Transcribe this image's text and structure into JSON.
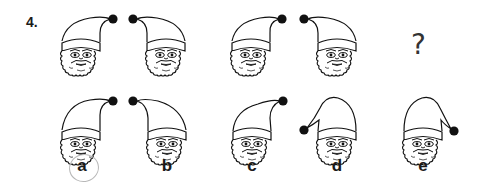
{
  "question": {
    "number": "4.",
    "missing_marker": "?",
    "answer_marked": "a"
  },
  "colors": {
    "ink": "#111111",
    "mark_circle": "#b8b8b8"
  },
  "sequence": [
    {
      "id": "seq-1",
      "hat": "pompom-top-right",
      "pompom": [
        113,
        19
      ],
      "face_center": [
        81,
        55
      ]
    },
    {
      "id": "seq-2",
      "hat": "pompom-top-left",
      "pompom": [
        133,
        19
      ],
      "face_center": [
        166,
        55
      ]
    },
    {
      "id": "seq-3",
      "hat": "pompom-top-right",
      "pompom": [
        282,
        19
      ],
      "face_center": [
        251,
        55
      ]
    },
    {
      "id": "seq-4",
      "hat": "pompom-top-left",
      "pompom": [
        304,
        19
      ],
      "face_center": [
        337,
        55
      ]
    },
    {
      "id": "seq-5",
      "hat": "missing",
      "symbol": "?"
    }
  ],
  "options": [
    {
      "label": "a",
      "hat": "pompom-top-right",
      "pompom": [
        113,
        101
      ],
      "face_center": [
        81,
        144
      ]
    },
    {
      "label": "b",
      "hat": "pompom-top-left",
      "pompom": [
        133,
        101
      ],
      "face_center": [
        167,
        144
      ]
    },
    {
      "label": "c",
      "hat": "pompom-top-right",
      "pompom": [
        283,
        101
      ],
      "face_center": [
        252,
        144
      ]
    },
    {
      "label": "d",
      "hat": "pompom-low-left",
      "pompom": [
        304,
        130
      ],
      "face_center": [
        337,
        144
      ]
    },
    {
      "label": "e",
      "hat": "pompom-low-right",
      "pompom": [
        454,
        131
      ],
      "face_center": [
        423,
        144
      ]
    }
  ]
}
